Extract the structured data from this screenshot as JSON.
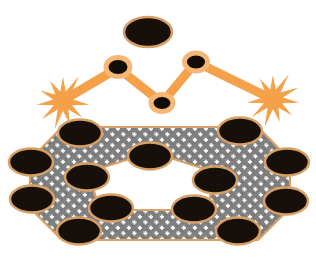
{
  "canvas": {
    "width": 316,
    "height": 258,
    "background": "#ffffff"
  },
  "palette": {
    "orange": "#f5a14a",
    "orange_light": "#f7b877",
    "tan_border": "#d9a066",
    "tan_border_light": "#e8c090",
    "node_black": "#120d07",
    "ellipse_black": "#17100a",
    "texture_gray": "#7c7c7c",
    "texture_dot": "#ffffff",
    "hole_white": "#ffffff"
  },
  "figure": {
    "parts": [
      {
        "name": "top-ellipse",
        "kind": "ellipse"
      },
      {
        "name": "zigzag-connector",
        "kind": "polyline"
      },
      {
        "name": "left-starburst",
        "kind": "starburst"
      },
      {
        "name": "right-starburst",
        "kind": "starburst"
      },
      {
        "name": "textured-ring-polygon",
        "kind": "polygon-with-hole"
      }
    ]
  },
  "top_ellipse": {
    "label": "top-ellipse",
    "cx": 148,
    "cy": 32,
    "rx": 24,
    "ry": 15,
    "fill": "#17100a",
    "stroke": "#d9a066",
    "stroke_width": 2.5
  },
  "zigzag": {
    "label": "zigzag-connector",
    "stroke": "#f5a14a",
    "stroke_width": 9,
    "points": [
      {
        "name": "left-start",
        "x": 62,
        "y": 101
      },
      {
        "name": "peak-left",
        "x": 118,
        "y": 68
      },
      {
        "name": "valley-middle",
        "x": 162,
        "y": 103
      },
      {
        "name": "peak-right",
        "x": 196,
        "y": 62
      },
      {
        "name": "right-end",
        "x": 272,
        "y": 99
      }
    ],
    "nodes": [
      {
        "name": "node-peak-left",
        "cx": 118,
        "cy": 67,
        "rx": 12,
        "ry": 9.5
      },
      {
        "name": "node-valley-middle",
        "cx": 162,
        "cy": 103,
        "rx": 11,
        "ry": 8.5
      },
      {
        "name": "node-peak-right",
        "cx": 196,
        "cy": 62,
        "rx": 11.5,
        "ry": 9
      }
    ],
    "node_fill": "#120d07",
    "node_stroke": "#f7b877",
    "node_stroke_width": 4
  },
  "starbursts": [
    {
      "name": "left-starburst",
      "cx": 63,
      "cy": 101,
      "r_outer": 24,
      "r_inner": 10,
      "spikes": 11,
      "fill": "#f5a14a"
    },
    {
      "name": "right-starburst",
      "cx": 273,
      "cy": 99,
      "r_outer": 24,
      "r_inner": 10,
      "spikes": 11,
      "fill": "#f5a14a"
    }
  ],
  "ring_polygon": {
    "label": "textured-ring-polygon",
    "fill_texture": "cross-dot-gray",
    "stroke": "#d9a066",
    "stroke_width": 2.2,
    "outer_points": [
      {
        "x": 62,
        "y": 127
      },
      {
        "x": 258,
        "y": 127
      },
      {
        "x": 290,
        "y": 160
      },
      {
        "x": 290,
        "y": 208
      },
      {
        "x": 258,
        "y": 240
      },
      {
        "x": 62,
        "y": 240
      },
      {
        "x": 30,
        "y": 208
      },
      {
        "x": 30,
        "y": 160
      }
    ],
    "inner_points": [
      {
        "x": 152,
        "y": 152
      },
      {
        "x": 214,
        "y": 172
      },
      {
        "x": 208,
        "y": 210
      },
      {
        "x": 100,
        "y": 210
      },
      {
        "x": 88,
        "y": 172
      }
    ]
  },
  "perimeter_ellipses": [
    {
      "name": "ellipse-top-left",
      "cx": 80,
      "cy": 133,
      "rx": 22,
      "ry": 13.5,
      "angle": 0
    },
    {
      "name": "ellipse-top-right",
      "cx": 240,
      "cy": 131,
      "rx": 22,
      "ry": 13.5,
      "angle": 0
    },
    {
      "name": "ellipse-left-upper",
      "cx": 31,
      "cy": 162,
      "rx": 22,
      "ry": 13.5,
      "angle": 0
    },
    {
      "name": "ellipse-right-upper",
      "cx": 287,
      "cy": 162,
      "rx": 22,
      "ry": 13.5,
      "angle": 0
    },
    {
      "name": "ellipse-left-lower",
      "cx": 32,
      "cy": 199,
      "rx": 22,
      "ry": 13.5,
      "angle": 0
    },
    {
      "name": "ellipse-right-lower",
      "cx": 286,
      "cy": 201,
      "rx": 22,
      "ry": 13.5,
      "angle": 0
    },
    {
      "name": "ellipse-bottom-left",
      "cx": 79,
      "cy": 231,
      "rx": 22,
      "ry": 13.5,
      "angle": 0
    },
    {
      "name": "ellipse-bottom-right",
      "cx": 238,
      "cy": 231,
      "rx": 22,
      "ry": 13.5,
      "angle": 0
    },
    {
      "name": "ellipse-inner-top",
      "cx": 150,
      "cy": 156,
      "rx": 22,
      "ry": 13.5,
      "angle": 0
    },
    {
      "name": "ellipse-inner-left",
      "cx": 87,
      "cy": 177,
      "rx": 22,
      "ry": 13.5,
      "angle": 0
    },
    {
      "name": "ellipse-inner-right",
      "cx": 215,
      "cy": 180,
      "rx": 22,
      "ry": 13.5,
      "angle": 0
    },
    {
      "name": "ellipse-inner-bot-left",
      "cx": 111,
      "cy": 208,
      "rx": 22,
      "ry": 13.5,
      "angle": 0
    },
    {
      "name": "ellipse-inner-bot-right",
      "cx": 194,
      "cy": 209,
      "rx": 22,
      "ry": 13.5,
      "angle": 0
    }
  ],
  "ellipse_style": {
    "fill": "#17100a",
    "stroke": "#d9a066",
    "stroke_width": 2.5
  }
}
